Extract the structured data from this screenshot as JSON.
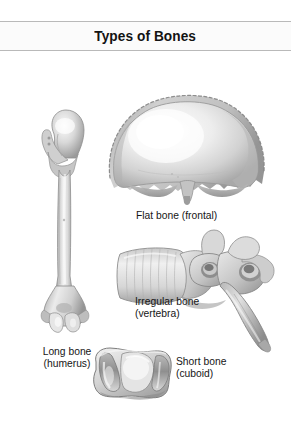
{
  "figure": {
    "title": "Types of Bones",
    "background_color": "#ffffff",
    "rule_color": "#b9b9b9",
    "title_band_color": "#fbfbfb",
    "text_color": "#161616",
    "illustration_style": "grayscale pencil/airbrush anatomical rendering"
  },
  "bones": [
    {
      "id": "long",
      "label": "Long bone\n(humerus)",
      "label_line1": "Long bone",
      "label_line2": "(humerus)",
      "category": "Long bone",
      "example": "humerus",
      "icon": "humerus-bone-illustration"
    },
    {
      "id": "flat",
      "label": "Flat bone (frontal)",
      "label_line1": "Flat bone (frontal)",
      "label_line2": "",
      "category": "Flat bone",
      "example": "frontal",
      "icon": "frontal-bone-illustration"
    },
    {
      "id": "irregular",
      "label": "Irregular bone\n(vertebra)",
      "label_line1": "Irregular bone",
      "label_line2": "(vertebra)",
      "category": "Irregular bone",
      "example": "vertebra",
      "icon": "vertebra-bone-illustration"
    },
    {
      "id": "short",
      "label": "Short bone\n(cuboid)",
      "label_line1": "Short bone",
      "label_line2": "(cuboid)",
      "category": "Short bone",
      "example": "cuboid",
      "icon": "cuboid-bone-illustration"
    }
  ]
}
